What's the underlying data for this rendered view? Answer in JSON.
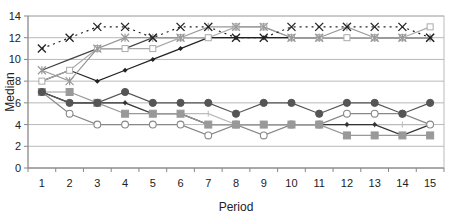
{
  "chart_data": {
    "type": "line",
    "title": "",
    "xlabel": "Period",
    "ylabel": "Median",
    "x": [
      1,
      2,
      3,
      4,
      5,
      6,
      7,
      8,
      9,
      10,
      11,
      12,
      13,
      14,
      15
    ],
    "ylim": [
      0,
      14
    ],
    "yticks": [
      0,
      2,
      4,
      6,
      8,
      10,
      12,
      14
    ],
    "grid": true,
    "legend": "none",
    "series": [
      {
        "name": "Series A (x-marker, dotted)",
        "marker": "x",
        "dash": "2,4",
        "color": "#222222",
        "values": [
          11,
          12,
          13,
          13,
          12,
          13,
          13,
          12,
          12,
          13,
          13,
          13,
          13,
          13,
          12
        ]
      },
      {
        "name": "Series B (asterisk)",
        "marker": "asterisk",
        "dash": "",
        "color": "#999999",
        "values": [
          9,
          8,
          11,
          12,
          12,
          12,
          13,
          13,
          13,
          12,
          12,
          13,
          12,
          12,
          12
        ]
      },
      {
        "name": "Series C (open square)",
        "marker": "open-square",
        "dash": "",
        "color": "#aaaaaa",
        "values": [
          8,
          9,
          11,
          11,
          11,
          12,
          12,
          13,
          13,
          12,
          12,
          12,
          12,
          12,
          13
        ]
      },
      {
        "name": "Series D (small diamond)",
        "marker": "small-diamond",
        "dash": "",
        "color": "#222222",
        "values": [
          8,
          9,
          8,
          9,
          10,
          11,
          12,
          12,
          12,
          12,
          12,
          12,
          12,
          12,
          12
        ]
      },
      {
        "name": "Series E (plain)",
        "marker": "none",
        "dash": "",
        "color": "#444444",
        "values": [
          9,
          10,
          11,
          11,
          12,
          12,
          12,
          12,
          12,
          12,
          12,
          12,
          12,
          12,
          12
        ]
      },
      {
        "name": "Series F (filled circle)",
        "marker": "filled-circle",
        "dash": "",
        "color": "#555555",
        "values": [
          7,
          6,
          6,
          7,
          6,
          6,
          6,
          5,
          6,
          6,
          5,
          6,
          6,
          5,
          6
        ]
      },
      {
        "name": "Series G (gray square)",
        "marker": "filled-square",
        "dash": "",
        "color": "#999999",
        "values": [
          7,
          7,
          6,
          5,
          5,
          5,
          4,
          4,
          4,
          4,
          4,
          3,
          3,
          3,
          3
        ]
      },
      {
        "name": "Series H (open diamond)",
        "marker": "open-diamond",
        "dash": "",
        "color": "#888888",
        "values": [
          7,
          5,
          4,
          4,
          4,
          4,
          3,
          4,
          3,
          4,
          4,
          5,
          5,
          5,
          4
        ]
      },
      {
        "name": "Series I (small filled diamond)",
        "marker": "small-diamond",
        "dash": "",
        "color": "#333333",
        "values": [
          7,
          6,
          6,
          6,
          5,
          5,
          4,
          4,
          4,
          4,
          4,
          4,
          4,
          3,
          4
        ]
      },
      {
        "name": "Series J (dash marker)",
        "marker": "dash",
        "dash": "",
        "color": "#bbbbbb",
        "values": [
          7,
          6,
          6,
          6,
          5,
          5,
          5,
          4,
          4,
          4,
          4,
          4,
          4,
          4,
          4
        ]
      }
    ]
  }
}
